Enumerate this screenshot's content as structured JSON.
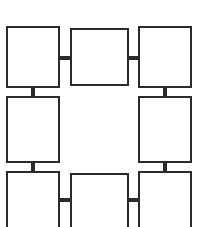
{
  "diagram": {
    "type": "block-diagram",
    "canvas": {
      "width": 199,
      "height": 227,
      "background_color": "#ffffff"
    },
    "style": {
      "box_fill": "#ffffff",
      "box_stroke": "#2b2b2b",
      "box_stroke_width": 2,
      "connector_color": "#2b2b2b",
      "connector_thickness": 4
    },
    "nodes": [
      {
        "id": "node-top-left",
        "label": "",
        "row": 1,
        "column": 1,
        "x": 6,
        "y": 26,
        "width": 54,
        "height": 62,
        "clipped": false
      },
      {
        "id": "node-top-center",
        "label": "",
        "row": 1,
        "column": 2,
        "x": 70,
        "y": 28,
        "width": 59,
        "height": 58,
        "clipped": false
      },
      {
        "id": "node-top-right",
        "label": "",
        "row": 1,
        "column": 3,
        "x": 138,
        "y": 26,
        "width": 54,
        "height": 62,
        "clipped": false
      },
      {
        "id": "node-middle-left",
        "label": "",
        "row": 2,
        "column": 1,
        "x": 6,
        "y": 96,
        "width": 54,
        "height": 67,
        "clipped": false
      },
      {
        "id": "node-middle-right",
        "label": "",
        "row": 2,
        "column": 3,
        "x": 138,
        "y": 96,
        "width": 54,
        "height": 67,
        "clipped": false
      },
      {
        "id": "node-bottom-left",
        "label": "",
        "row": 3,
        "column": 1,
        "x": 6,
        "y": 171,
        "width": 54,
        "height": 56,
        "clipped": true
      },
      {
        "id": "node-bottom-center",
        "label": "",
        "row": 3,
        "column": 2,
        "x": 70,
        "y": 173,
        "width": 59,
        "height": 54,
        "clipped": true
      },
      {
        "id": "node-bottom-right",
        "label": "",
        "row": 3,
        "column": 3,
        "x": 138,
        "y": 171,
        "width": 54,
        "height": 56,
        "clipped": true
      }
    ],
    "connectors": [
      {
        "id": "connector-top-left-to-top-center",
        "orientation": "horizontal",
        "from": "node-top-left",
        "to": "node-top-center",
        "x": 58,
        "y": 56,
        "length": 14,
        "thickness": 4
      },
      {
        "id": "connector-top-center-to-top-right",
        "orientation": "horizontal",
        "from": "node-top-center",
        "to": "node-top-right",
        "x": 127,
        "y": 56,
        "length": 13,
        "thickness": 4
      },
      {
        "id": "connector-top-left-to-middle-left",
        "orientation": "vertical",
        "from": "node-top-left",
        "to": "node-middle-left",
        "x": 31,
        "y": 86,
        "length": 12,
        "thickness": 4
      },
      {
        "id": "connector-top-right-to-middle-right",
        "orientation": "vertical",
        "from": "node-top-right",
        "to": "node-middle-right",
        "x": 163,
        "y": 86,
        "length": 12,
        "thickness": 4
      },
      {
        "id": "connector-middle-left-to-bottom-left",
        "orientation": "vertical",
        "from": "node-middle-left",
        "to": "node-bottom-left",
        "x": 31,
        "y": 161,
        "length": 12,
        "thickness": 4
      },
      {
        "id": "connector-middle-right-to-bottom-right",
        "orientation": "vertical",
        "from": "node-middle-right",
        "to": "node-bottom-right",
        "x": 163,
        "y": 161,
        "length": 12,
        "thickness": 4
      },
      {
        "id": "connector-bottom-left-to-bottom-center",
        "orientation": "horizontal",
        "from": "node-bottom-left",
        "to": "node-bottom-center",
        "x": 58,
        "y": 198,
        "length": 14,
        "thickness": 4
      },
      {
        "id": "connector-bottom-center-to-bottom-right",
        "orientation": "horizontal",
        "from": "node-bottom-center",
        "to": "node-bottom-right",
        "x": 127,
        "y": 198,
        "length": 13,
        "thickness": 4
      }
    ]
  }
}
